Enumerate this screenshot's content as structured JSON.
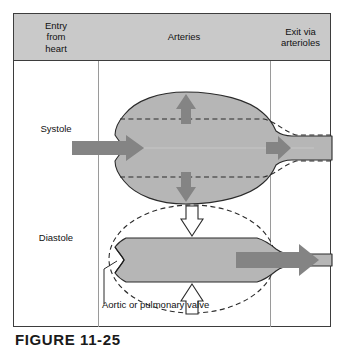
{
  "figure": {
    "caption": "FIGURE 11-25",
    "columns": [
      {
        "key": "entry",
        "label": "Entry\nfrom\nheart",
        "label_lines": [
          "Entry",
          "from",
          "heart"
        ]
      },
      {
        "key": "arteries",
        "label": "Arteries",
        "label_lines": [
          "Arteries"
        ]
      },
      {
        "key": "exit",
        "label": "Exit via\narterioles",
        "label_lines": [
          "Exit via",
          "arterioles"
        ]
      }
    ],
    "column_labels": {
      "entry": "Entry from heart",
      "arteries": "Arteries",
      "exit": "Exit via arterioles"
    },
    "rows": [
      {
        "key": "systole",
        "label": "Systole"
      },
      {
        "key": "diastole",
        "label": "Diastole"
      }
    ],
    "row_labels": {
      "systole": "Systole",
      "diastole": "Diastole"
    },
    "annotations": {
      "valve": "Aortic or pulmonary valve"
    },
    "colors": {
      "header_fill": "#c9c9c9",
      "vessel_fill": "#b6b6b6",
      "arrow_fill": "#848484",
      "arrow_outline_fill": "#ffffff",
      "outline": "#2b2b2b",
      "frame_border": "#3d3d3d",
      "divider": "#9a9a9a",
      "text": "#111111",
      "page_background": "#ffffff"
    },
    "legend_semantics": {
      "systole_inflow_arrow": "blood entering artery from heart during systole",
      "systole_wall_arrows": "artery wall stretching outward",
      "systole_outflow_arrow": "small outflow to arterioles",
      "diastole_wall_arrows": "elastic recoil of artery wall inward",
      "diastole_outflow_arrow": "blood propelled onward to arterioles",
      "dashed_outline_systole": "relaxed (diastolic) vessel diameter",
      "dashed_outline_diastole": "previous distended (systolic) vessel outline"
    }
  }
}
